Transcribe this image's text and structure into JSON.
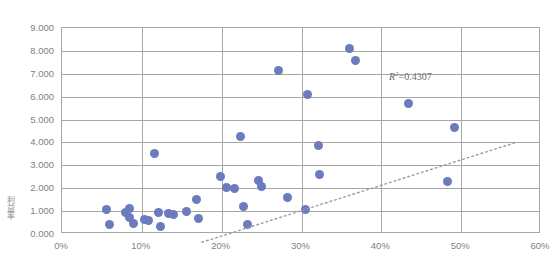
{
  "chart_data": {
    "type": "scatter",
    "title": "",
    "xlabel": "",
    "ylabel": "利益率",
    "xlim": [
      0,
      60
    ],
    "ylim": [
      0,
      9
    ],
    "grid": true,
    "legend": false,
    "x_tick_labels": [
      "0%",
      "10%",
      "20%",
      "30%",
      "40%",
      "50%",
      "60%"
    ],
    "x_ticks": [
      0,
      10,
      20,
      30,
      40,
      50,
      60
    ],
    "y_tick_labels": [
      "0.000",
      "1.000",
      "2.000",
      "3.000",
      "4.000",
      "5.000",
      "6.000",
      "7.000",
      "8.000",
      "9.000"
    ],
    "y_ticks": [
      0,
      1,
      2,
      3,
      4,
      5,
      6,
      7,
      8,
      9
    ],
    "annotations": [
      {
        "name": "r-squared",
        "prefix": "R",
        "superscript": "2",
        "equals": "=",
        "value": "0.4307",
        "x": 41.1,
        "y": 6.25
      }
    ],
    "series": [
      {
        "name": "data",
        "marker": "circle",
        "color": "#6c7bbd",
        "points": [
          {
            "x": 5.6,
            "y": 1.05
          },
          {
            "x": 5.9,
            "y": 0.42
          },
          {
            "x": 7.9,
            "y": 0.95
          },
          {
            "x": 8.4,
            "y": 0.72
          },
          {
            "x": 8.5,
            "y": 1.1
          },
          {
            "x": 9.0,
            "y": 0.45
          },
          {
            "x": 10.3,
            "y": 0.63
          },
          {
            "x": 10.8,
            "y": 0.58
          },
          {
            "x": 11.6,
            "y": 3.5
          },
          {
            "x": 12.1,
            "y": 0.95
          },
          {
            "x": 12.3,
            "y": 0.32
          },
          {
            "x": 13.4,
            "y": 0.88
          },
          {
            "x": 14.0,
            "y": 0.85
          },
          {
            "x": 15.6,
            "y": 1.0
          },
          {
            "x": 16.8,
            "y": 1.52
          },
          {
            "x": 17.1,
            "y": 0.68
          },
          {
            "x": 19.9,
            "y": 2.52
          },
          {
            "x": 20.6,
            "y": 2.02
          },
          {
            "x": 21.6,
            "y": 2.0
          },
          {
            "x": 22.4,
            "y": 4.25
          },
          {
            "x": 22.7,
            "y": 1.18
          },
          {
            "x": 23.2,
            "y": 0.42
          },
          {
            "x": 24.6,
            "y": 2.35
          },
          {
            "x": 25.0,
            "y": 2.08
          },
          {
            "x": 27.1,
            "y": 7.15
          },
          {
            "x": 28.3,
            "y": 1.6
          },
          {
            "x": 30.8,
            "y": 6.08
          },
          {
            "x": 30.5,
            "y": 1.05
          },
          {
            "x": 32.1,
            "y": 3.85
          },
          {
            "x": 32.3,
            "y": 2.58
          },
          {
            "x": 36.0,
            "y": 8.1
          },
          {
            "x": 36.8,
            "y": 7.6
          },
          {
            "x": 43.4,
            "y": 5.68
          },
          {
            "x": 48.3,
            "y": 2.3
          },
          {
            "x": 49.2,
            "y": 4.65
          }
        ]
      }
    ],
    "trendline": {
      "name": "linear-trendline",
      "style": "dotted",
      "color": "#9a9a9a",
      "x_start": 9.9,
      "y_start": 0.82,
      "x_end": 49.4,
      "y_end": 5.2
    }
  }
}
